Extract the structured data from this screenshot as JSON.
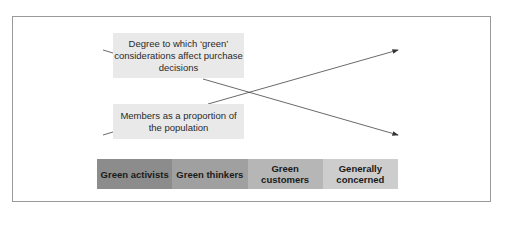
{
  "diagram": {
    "labels": {
      "degree": "Degree to which ‘green’ considerations affect purchase decisions",
      "members": "Members as a proportion of the population"
    },
    "segments": [
      {
        "label": "Green activists",
        "color": "#8c8c8c"
      },
      {
        "label": "Green thinkers",
        "color": "#a0a0a0"
      },
      {
        "label": "Green customers",
        "color": "#b6b6b6"
      },
      {
        "label": "Generally concerned",
        "color": "#cdcdcd"
      }
    ],
    "trends": [
      {
        "name": "Degree to which green considerations affect purchase decisions",
        "direction": "decreasing"
      },
      {
        "name": "Members as a proportion of the population",
        "direction": "increasing"
      }
    ]
  }
}
